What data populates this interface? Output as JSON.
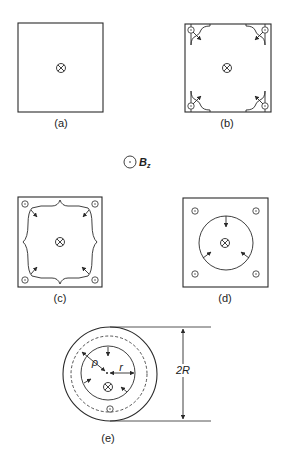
{
  "panels": {
    "a": {
      "label": "(a)",
      "description": "Square cross-section, field into page at center"
    },
    "b": {
      "label": "(b)",
      "description": "Square with corner regions, arrows pointing inward"
    },
    "c": {
      "label": "(c)",
      "description": "Square with cusped boundary, arrows pointing inward"
    },
    "d": {
      "label": "(d)",
      "description": "Square with inner circle, arrows pointing inward"
    },
    "e": {
      "label": "(e)",
      "description": "Circular cross-section with radii"
    }
  },
  "legend": {
    "symbol": "dot-in-circle",
    "text_main": "B",
    "text_sub": "z"
  },
  "annotations": {
    "rho": "ρ",
    "r": "r",
    "diameter": "2R"
  },
  "symbols": {
    "into_page": "cross-in-circle",
    "out_of_page": "dot-in-circle"
  },
  "colors": {
    "line": "#2a2a2a",
    "background": "#ffffff"
  }
}
